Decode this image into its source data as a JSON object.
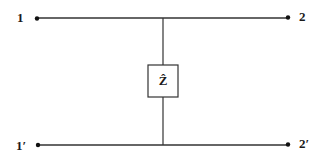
{
  "diagram": {
    "type": "two-port network",
    "terminals": [
      {
        "id": "t1",
        "label": "1",
        "x": 37,
        "y": 18
      },
      {
        "id": "t2",
        "label": "2",
        "x": 288,
        "y": 18
      },
      {
        "id": "t1p",
        "label": "1′",
        "x": 37,
        "y": 145
      },
      {
        "id": "t2p",
        "label": "2′",
        "x": 288,
        "y": 145
      }
    ],
    "impedance": {
      "label": "Ẑ",
      "symbol": "Z",
      "accent": "^"
    },
    "colors": {
      "line": "#333333",
      "dot": "#111111",
      "background": "#ffffff"
    }
  }
}
